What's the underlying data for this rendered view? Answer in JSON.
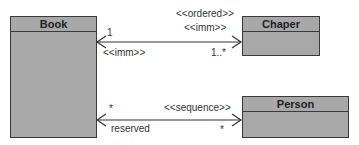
{
  "classes": {
    "book": {
      "name": "Book"
    },
    "chapter": {
      "name": "Chaper"
    },
    "person": {
      "name": "Person"
    }
  },
  "associations": {
    "book_chapter": {
      "source_multiplicity": "1",
      "source_stereotype": "<<imm>>",
      "target_stereotype_1": "<<ordered>>",
      "target_stereotype_2": "<<imm>>",
      "target_multiplicity": "1..*"
    },
    "book_person": {
      "source_multiplicity": "*",
      "source_role": "reserved",
      "target_stereotype": "<<sequence>>",
      "target_multiplicity": "*"
    }
  },
  "colors": {
    "class_fill": "#a8a8a8",
    "border": "#3a3a3a",
    "line": "#333333"
  }
}
